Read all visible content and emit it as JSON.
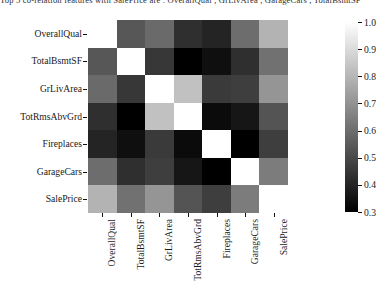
{
  "top_text": "Top  5  co-relation  features  with  SalePrice  are  :  OverallQual  ,  GrLivArea  ,  GarageCars  ,  TotalBsmtSF",
  "chart_data": {
    "type": "heatmap",
    "title": "",
    "xlabel": "",
    "ylabel": "",
    "categories": [
      "OverallQual",
      "TotalBsmtSF",
      "GrLivArea",
      "TotRmsAbvGrd",
      "Fireplaces",
      "GarageCars",
      "SalePrice"
    ],
    "x_tick_labels": [
      "OverallQual",
      "TotalBsmtSF",
      "GrLivArea",
      "TotRmsAbvGrd",
      "Fireplaces",
      "GarageCars",
      "SalePrice"
    ],
    "y_tick_labels": [
      "OverallQual",
      "TotalBsmtSF",
      "GrLivArea",
      "TotRmsAbvGrd",
      "Fireplaces",
      "GarageCars",
      "SalePrice"
    ],
    "colormap": "gray",
    "vmin": 0.3,
    "vmax": 1.0,
    "grid": false,
    "colorbar": {
      "position": "right",
      "orientation": "vertical",
      "ticks": [
        1.0,
        0.9,
        0.8,
        0.7,
        0.6,
        0.5,
        0.4,
        0.3
      ],
      "tick_labels": [
        "1.0",
        "0.9",
        "0.8",
        "0.7",
        "0.6",
        "0.5",
        "0.4",
        "0.3"
      ],
      "gradient_top_color": "#ffffff",
      "gradient_bottom_color": "#000000"
    },
    "matrix": [
      [
        1.0,
        0.54,
        0.59,
        0.43,
        0.4,
        0.6,
        0.79
      ],
      [
        0.54,
        1.0,
        0.45,
        0.29,
        0.34,
        0.43,
        0.61
      ],
      [
        0.59,
        0.45,
        1.0,
        0.83,
        0.46,
        0.47,
        0.71
      ],
      [
        0.43,
        0.29,
        0.83,
        1.0,
        0.33,
        0.36,
        0.53
      ],
      [
        0.4,
        0.34,
        0.46,
        0.33,
        1.0,
        0.3,
        0.47
      ],
      [
        0.6,
        0.43,
        0.47,
        0.36,
        0.3,
        1.0,
        0.64
      ],
      [
        0.79,
        0.61,
        0.71,
        0.53,
        0.47,
        0.64,
        1.0
      ]
    ]
  }
}
